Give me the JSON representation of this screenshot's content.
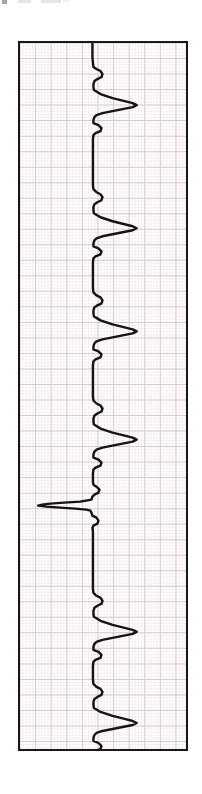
{
  "document": {
    "kind": "ecg-rhythm-strip-scan",
    "orientation": "rotated-90",
    "background_color": "#ffffff",
    "page_width": 202,
    "page_height": 794
  },
  "artifacts": {
    "description": "faint scanner ghost marks at top edge",
    "marks": [
      {
        "name": "ghost-mark-1",
        "x": 2,
        "width": 5,
        "color": "#8d8d93"
      },
      {
        "name": "ghost-mark-2",
        "x": 18,
        "width": 13,
        "color": "#cfcfd4"
      },
      {
        "name": "ghost-mark-3",
        "x": 41,
        "width": 20,
        "color": "#cfcfd4"
      },
      {
        "name": "ghost-mark-4",
        "x": 63,
        "width": 6,
        "color": "#cfcfd4"
      }
    ]
  },
  "strip": {
    "name": "ecg-paper-strip",
    "frame_color": "#181818",
    "frame_width": 2.5,
    "left": 18,
    "top": 41,
    "width": 170,
    "height": 710,
    "paper_color": "#ffffff"
  },
  "grid": {
    "name": "ecg-graph-paper-grid",
    "minor_spacing_px": 3.1,
    "major_spacing_px": 15.5,
    "minor_color": "#f0e3e6",
    "major_color": "#dcc9cf",
    "minor_width": 0.5,
    "major_width": 1.0
  },
  "chart_data": {
    "type": "line",
    "title": "",
    "xlabel": "",
    "ylabel": "",
    "orientation": "vertical-time-axis",
    "note": "Single-lead ECG rhythm strip printed on graph paper and scanned rotated 90 degrees; time runs top-to-bottom, amplitude deflects left-to-right from the baseline.",
    "baseline_x_px": 72,
    "trace_color": "#141414",
    "trace_width": 2.4,
    "axis_ranges": {
      "time_px": [
        0,
        710
      ],
      "amplitude_px": [
        0,
        170
      ]
    },
    "grid": true,
    "legend": "none",
    "beats": [
      {
        "index": 1,
        "t_px": 36,
        "morphology": "normal",
        "p_wave": true,
        "r_amplitude_px": 44,
        "s_deflection_px": -13
      },
      {
        "index": 2,
        "t_px": 144,
        "morphology": "normal",
        "p_wave": true,
        "r_amplitude_px": 42,
        "s_deflection_px": -13
      },
      {
        "index": 3,
        "t_px": 245,
        "morphology": "normal",
        "p_wave": true,
        "r_amplitude_px": 43,
        "s_deflection_px": -13
      },
      {
        "index": 4,
        "t_px": 353,
        "morphology": "normal",
        "p_wave": true,
        "r_amplitude_px": 43,
        "s_deflection_px": -13
      },
      {
        "index": 5,
        "t_px": 450,
        "morphology": "inverted-low-amplitude",
        "p_wave": false,
        "r_amplitude_px": -48,
        "s_deflection_px": 10
      },
      {
        "index": 6,
        "t_px": 545,
        "morphology": "normal",
        "p_wave": true,
        "r_amplitude_px": 43,
        "s_deflection_px": -13
      },
      {
        "index": 7,
        "t_px": 638,
        "morphology": "normal",
        "p_wave": true,
        "r_amplitude_px": 42,
        "s_deflection_px": -13
      }
    ],
    "series": [
      {
        "name": "ecg-lead-trace",
        "points": [
          [
            72,
            0
          ],
          [
            72,
            14
          ],
          [
            72.5,
            20
          ],
          [
            73,
            24
          ],
          [
            76,
            26
          ],
          [
            80,
            28
          ],
          [
            82,
            31
          ],
          [
            81,
            34
          ],
          [
            77,
            36
          ],
          [
            74,
            38
          ],
          [
            73,
            41
          ],
          [
            73,
            44
          ],
          [
            73.5,
            47
          ],
          [
            80,
            51
          ],
          [
            92,
            55
          ],
          [
            104,
            58
          ],
          [
            112,
            60
          ],
          [
            116,
            62
          ],
          [
            112,
            64
          ],
          [
            102,
            66
          ],
          [
            92,
            68
          ],
          [
            82,
            70
          ],
          [
            76,
            72
          ],
          [
            74,
            74
          ],
          [
            73,
            77
          ],
          [
            73,
            80
          ],
          [
            78,
            82
          ],
          [
            81,
            85
          ],
          [
            80,
            88
          ],
          [
            75,
            90
          ],
          [
            73,
            92
          ],
          [
            72.5,
            96
          ],
          [
            72.5,
            110
          ],
          [
            72.5,
            125
          ],
          [
            72.5,
            140
          ],
          [
            72.5,
            142
          ],
          [
            73,
            146
          ],
          [
            76,
            149
          ],
          [
            80,
            151
          ],
          [
            82,
            154
          ],
          [
            81,
            157
          ],
          [
            77,
            159
          ],
          [
            74,
            161
          ],
          [
            73,
            164
          ],
          [
            73,
            167
          ],
          [
            73.5,
            170
          ],
          [
            80,
            174
          ],
          [
            92,
            178
          ],
          [
            104,
            181
          ],
          [
            112,
            183
          ],
          [
            116,
            185
          ],
          [
            112,
            187
          ],
          [
            102,
            189
          ],
          [
            92,
            191
          ],
          [
            82,
            193
          ],
          [
            76,
            195
          ],
          [
            74,
            197
          ],
          [
            73,
            200
          ],
          [
            73,
            203
          ],
          [
            78,
            205
          ],
          [
            81,
            208
          ],
          [
            80,
            211
          ],
          [
            75,
            213
          ],
          [
            73,
            215
          ],
          [
            72.5,
            219
          ],
          [
            72.5,
            232
          ],
          [
            72.5,
            243
          ],
          [
            72.5,
            245
          ],
          [
            73,
            249
          ],
          [
            76,
            252
          ],
          [
            80,
            254
          ],
          [
            82,
            257
          ],
          [
            81,
            260
          ],
          [
            77,
            262
          ],
          [
            74,
            264
          ],
          [
            73,
            267
          ],
          [
            73,
            270
          ],
          [
            73.5,
            273
          ],
          [
            80,
            277
          ],
          [
            92,
            281
          ],
          [
            104,
            284
          ],
          [
            112,
            286
          ],
          [
            116,
            288
          ],
          [
            112,
            290
          ],
          [
            102,
            292
          ],
          [
            92,
            294
          ],
          [
            82,
            296
          ],
          [
            76,
            298
          ],
          [
            74,
            300
          ],
          [
            73,
            303
          ],
          [
            73,
            306
          ],
          [
            78,
            308
          ],
          [
            81,
            311
          ],
          [
            80,
            314
          ],
          [
            75,
            316
          ],
          [
            73,
            318
          ],
          [
            72.5,
            322
          ],
          [
            72.5,
            336
          ],
          [
            72.5,
            351
          ],
          [
            72.5,
            353
          ],
          [
            73,
            357
          ],
          [
            76,
            360
          ],
          [
            80,
            362
          ],
          [
            82,
            365
          ],
          [
            81,
            368
          ],
          [
            77,
            370
          ],
          [
            74,
            372
          ],
          [
            73,
            375
          ],
          [
            73,
            378
          ],
          [
            73.5,
            381
          ],
          [
            80,
            385
          ],
          [
            92,
            389
          ],
          [
            104,
            392
          ],
          [
            112,
            394
          ],
          [
            116,
            396
          ],
          [
            112,
            398
          ],
          [
            102,
            400
          ],
          [
            92,
            402
          ],
          [
            82,
            404
          ],
          [
            76,
            406
          ],
          [
            74,
            408
          ],
          [
            73,
            411
          ],
          [
            73,
            414
          ],
          [
            78,
            416
          ],
          [
            81,
            419
          ],
          [
            80,
            422
          ],
          [
            75,
            424
          ],
          [
            73,
            426
          ],
          [
            72.5,
            430
          ],
          [
            72.5,
            436
          ],
          [
            72.5,
            438
          ],
          [
            73,
            441
          ],
          [
            76,
            443
          ],
          [
            79,
            446
          ],
          [
            78,
            449
          ],
          [
            74,
            451
          ],
          [
            72,
            453
          ],
          [
            71,
            456
          ],
          [
            60,
            458
          ],
          [
            44,
            459
          ],
          [
            30,
            460
          ],
          [
            22,
            461
          ],
          [
            18,
            462
          ],
          [
            26,
            463
          ],
          [
            40,
            464
          ],
          [
            55,
            465
          ],
          [
            66,
            466
          ],
          [
            70,
            467
          ],
          [
            71,
            469
          ],
          [
            72,
            472
          ],
          [
            76,
            474
          ],
          [
            78,
            477
          ],
          [
            77,
            480
          ],
          [
            73,
            482
          ],
          [
            72,
            484
          ],
          [
            72.5,
            488
          ],
          [
            72.5,
            510
          ],
          [
            72.5,
            530
          ],
          [
            72.5,
            543
          ],
          [
            72.5,
            545
          ],
          [
            73,
            549
          ],
          [
            76,
            552
          ],
          [
            80,
            554
          ],
          [
            82,
            557
          ],
          [
            81,
            560
          ],
          [
            77,
            562
          ],
          [
            74,
            564
          ],
          [
            73,
            567
          ],
          [
            73,
            570
          ],
          [
            73.5,
            573
          ],
          [
            80,
            577
          ],
          [
            92,
            581
          ],
          [
            104,
            584
          ],
          [
            112,
            586
          ],
          [
            116,
            588
          ],
          [
            112,
            590
          ],
          [
            102,
            592
          ],
          [
            92,
            594
          ],
          [
            82,
            596
          ],
          [
            76,
            598
          ],
          [
            74,
            600
          ],
          [
            73,
            603
          ],
          [
            73,
            606
          ],
          [
            78,
            608
          ],
          [
            81,
            611
          ],
          [
            80,
            614
          ],
          [
            75,
            616
          ],
          [
            73,
            618
          ],
          [
            72.5,
            622
          ],
          [
            72.5,
            634
          ],
          [
            72.5,
            636
          ],
          [
            73,
            640
          ],
          [
            76,
            643
          ],
          [
            80,
            645
          ],
          [
            82,
            648
          ],
          [
            81,
            651
          ],
          [
            77,
            653
          ],
          [
            74,
            655
          ],
          [
            73,
            658
          ],
          [
            73,
            661
          ],
          [
            73.5,
            664
          ],
          [
            80,
            668
          ],
          [
            92,
            672
          ],
          [
            104,
            675
          ],
          [
            112,
            677
          ],
          [
            116,
            679
          ],
          [
            112,
            681
          ],
          [
            102,
            683
          ],
          [
            92,
            685
          ],
          [
            82,
            687
          ],
          [
            76,
            689
          ],
          [
            74,
            691
          ],
          [
            73,
            694
          ],
          [
            73,
            697
          ],
          [
            78,
            699
          ],
          [
            81,
            702
          ],
          [
            80,
            705
          ],
          [
            75,
            707
          ],
          [
            73,
            709
          ],
          [
            72.5,
            712
          ],
          [
            72.5,
            710
          ]
        ]
      }
    ]
  }
}
